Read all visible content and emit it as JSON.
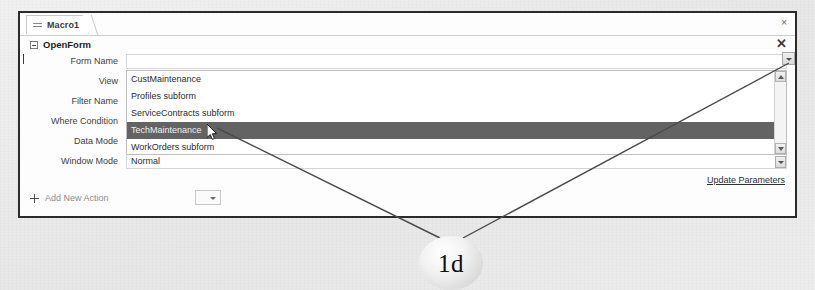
{
  "window": {
    "tab": {
      "label": "Macro1",
      "icon": "macro-lines-icon",
      "close_label": "×"
    }
  },
  "action_block": {
    "title": "OpenForm",
    "expander_icon": "collapse-minus-icon",
    "close_label": "✕",
    "arguments": [
      {
        "label": "Form Name",
        "value": ""
      },
      {
        "label": "View",
        "value": ""
      },
      {
        "label": "Filter Name",
        "value": ""
      },
      {
        "label": "Where Condition",
        "value": ""
      },
      {
        "label": "Data Mode",
        "value": ""
      },
      {
        "label": "Window Mode",
        "value": "Normal"
      }
    ],
    "update_parameters_label": "Update Parameters"
  },
  "dropdown": {
    "open": true,
    "selected": "TechMaintenance",
    "options": [
      "CustMaintenance",
      "Profiles subform",
      "ServiceContracts subform",
      "TechMaintenance",
      "WorkOrders subform"
    ],
    "scrollbar": {
      "up_icon": "scroll-up-arrow-icon",
      "down_icon": "scroll-down-arrow-icon"
    }
  },
  "add_new_action": {
    "label": "Add New Action",
    "plus_icon": "plus-icon",
    "combo_icon": "chevron-down-icon"
  },
  "annotation": {
    "callout_label": "1d",
    "cursor_icon": "mouse-pointer-icon"
  },
  "colors": {
    "selection": "#636363",
    "window_border": "#2b2b2b",
    "page_background": "#ebebeb",
    "field_background": "#ffffff"
  }
}
